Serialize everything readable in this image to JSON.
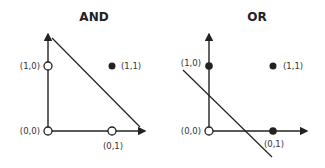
{
  "panels": [
    {
      "title": "AND",
      "points": [
        {
          "label": "(0,0)",
          "filled": false
        },
        {
          "label": "(1,0)",
          "filled": false
        },
        {
          "label": "(0,1)",
          "filled": false
        },
        {
          "label": "(1,1)",
          "filled": true
        }
      ]
    },
    {
      "title": "OR",
      "points": [
        {
          "label": "(0,0)",
          "filled": false
        },
        {
          "label": "(1,0)",
          "filled": true
        },
        {
          "label": "(0,1)",
          "filled": true
        },
        {
          "label": "(1,1)",
          "filled": true
        }
      ]
    }
  ],
  "colors": {
    "stroke": "#222222",
    "fill": "#222222",
    "hollow": "#ffffff"
  }
}
